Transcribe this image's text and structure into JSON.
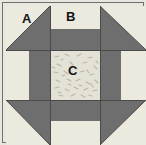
{
  "block": {
    "title": "Quilt Block Diagram",
    "width": 146,
    "height": 145
  },
  "colors": {
    "background": "#ffffff",
    "light_fabric": "#eceadf",
    "dark_fabric": "#6e6e6e",
    "center_fabric": "#e4e2d6",
    "seam_line": "#4a4a4a",
    "border_line": "#6f6f6f",
    "label_text": "#141414",
    "texture_mark": "#b9b6a6"
  },
  "labels": [
    {
      "id": "A",
      "text": "A",
      "x": 22,
      "y": 12,
      "refers_to": "corner-half-square-triangle-light"
    },
    {
      "id": "B",
      "text": "B",
      "x": 66,
      "y": 10,
      "refers_to": "edge-rectangle-light"
    },
    {
      "id": "C",
      "text": "C",
      "x": 68,
      "y": 64,
      "refers_to": "center-square-textured"
    }
  ],
  "pieces": {
    "corners": [
      {
        "name": "corner-top-left",
        "light_corner": "top-left",
        "dark_corner": "bottom-right"
      },
      {
        "name": "corner-top-right",
        "light_corner": "top-right",
        "dark_corner": "bottom-left"
      },
      {
        "name": "corner-bottom-left",
        "light_corner": "bottom-left",
        "dark_corner": "top-right"
      },
      {
        "name": "corner-bottom-right",
        "light_corner": "bottom-right",
        "dark_corner": "top-left"
      }
    ],
    "edges": [
      {
        "name": "edge-top",
        "outer": "light",
        "inner": "dark"
      },
      {
        "name": "edge-bottom",
        "outer": "light",
        "inner": "dark"
      },
      {
        "name": "edge-left",
        "outer": "light",
        "inner": "dark"
      },
      {
        "name": "edge-right",
        "outer": "light",
        "inner": "dark"
      }
    ],
    "center": {
      "name": "center-square",
      "fabric": "textured-light"
    }
  },
  "geometry": {
    "unit_cols": [
      0,
      44,
      94,
      140
    ],
    "unit_rows": [
      0,
      44,
      94,
      139
    ],
    "edge_split_ratio": 0.46
  }
}
